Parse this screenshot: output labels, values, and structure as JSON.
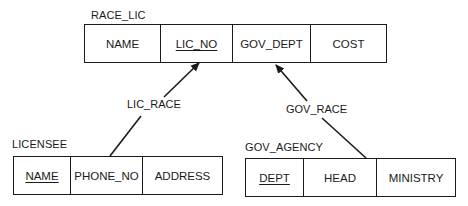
{
  "diagram": {
    "type": "relational-schema",
    "tables": [
      {
        "name": "RACE_LIC",
        "columns": [
          {
            "label": "NAME",
            "key": false
          },
          {
            "label": "LIC_NO",
            "key": true
          },
          {
            "label": "GOV_DEPT",
            "key": false
          },
          {
            "label": "COST",
            "key": false
          }
        ]
      },
      {
        "name": "LICENSEE",
        "columns": [
          {
            "label": "NAME",
            "key": true
          },
          {
            "label": "PHONE_NO",
            "key": false
          },
          {
            "label": "ADDRESS",
            "key": false
          }
        ]
      },
      {
        "name": "GOV_AGENCY",
        "columns": [
          {
            "label": "DEPT",
            "key": true
          },
          {
            "label": "HEAD",
            "key": false
          },
          {
            "label": "MINISTRY",
            "key": false
          }
        ]
      }
    ],
    "relationships": [
      {
        "label": "LIC_RACE",
        "from": "LICENSEE.PHONE_NO",
        "to": "RACE_LIC.LIC_NO"
      },
      {
        "label": "GOV_RACE",
        "from": "GOV_AGENCY.HEAD",
        "to": "RACE_LIC.GOV_DEPT"
      }
    ],
    "colors": {
      "line": "#1a1a1a",
      "background": "#ffffff"
    }
  }
}
